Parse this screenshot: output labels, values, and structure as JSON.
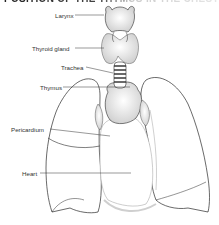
{
  "title": "POSITION OF THE THYMUS IN THE CHEST",
  "diagram": {
    "type": "anatomical-illustration",
    "labels": [
      {
        "id": "larynx",
        "text": "Larynx",
        "x": 55,
        "y": 12,
        "target": [
          104,
          15
        ]
      },
      {
        "id": "thyroid",
        "text": "Thyroid gland",
        "x": 32,
        "y": 45,
        "target": [
          104,
          48
        ]
      },
      {
        "id": "trachea",
        "text": "Trachea",
        "x": 61,
        "y": 64,
        "target": [
          113,
          73
        ]
      },
      {
        "id": "thymus",
        "text": "Thymus",
        "x": 40,
        "y": 84,
        "target": [
          130,
          87
        ]
      },
      {
        "id": "pericardium",
        "text": "Pericardium",
        "x": 11,
        "y": 126,
        "target": [
          110,
          136
        ]
      },
      {
        "id": "heart",
        "text": "Heart",
        "x": 22,
        "y": 170,
        "target": [
          131,
          173
        ]
      }
    ]
  },
  "colors": {
    "line": "#2a2a2a",
    "label": "#333333",
    "fill": "#ffffff",
    "shade": "#d8d8d8"
  }
}
